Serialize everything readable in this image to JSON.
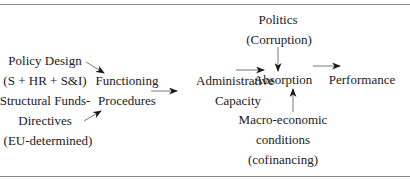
{
  "diagram": {
    "nodes": {
      "policy_design": [
        "Policy Design",
        "(S + HR + S&I)",
        "Structural Funds-",
        "Directives",
        "(EU-determined)"
      ],
      "functioning_procedures": [
        "Functioning",
        "Procedures"
      ],
      "administrative_capacity": [
        "Administrative",
        "Capacity"
      ],
      "politics": [
        "Politics",
        "(Corruption)"
      ],
      "absorption": [
        "Absorption"
      ],
      "performance": [
        "Performance"
      ],
      "macro_economic": [
        "Macro-economic",
        "conditions",
        "(cofinancing)"
      ]
    },
    "edges": [
      {
        "from": "Policy Design",
        "to": "Functioning Procedures"
      },
      {
        "from": "Structural Funds-Directives",
        "to": "Functioning Procedures"
      },
      {
        "from": "Functioning Procedures",
        "to": "Administrative Capacity"
      },
      {
        "from": "Administrative Capacity",
        "to": "Absorption"
      },
      {
        "from": "Politics (Corruption)",
        "to": "Absorption"
      },
      {
        "from": "Macro-economic conditions (cofinancing)",
        "to": "Absorption"
      },
      {
        "from": "Absorption",
        "to": "Performance"
      }
    ],
    "colors": {
      "text": "#1a1a1a",
      "arrow": "#1a1a1a",
      "rule": "#8a8a8a"
    }
  }
}
